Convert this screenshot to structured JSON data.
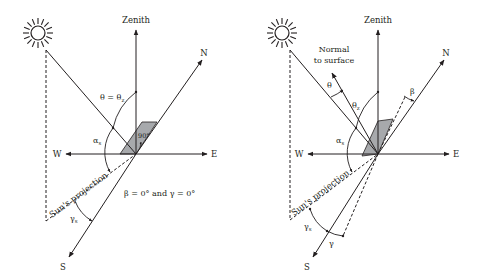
{
  "colors": {
    "line": "#231f20",
    "plate": "#a7a9ac",
    "background": "#ffffff"
  },
  "left_diagram": {
    "axes": {
      "zenith": "Zenith",
      "north": "N",
      "east": "E",
      "west": "W",
      "south": "S"
    },
    "sun_icon": "sun-icon",
    "angle_labels": {
      "theta_eq": "θ = θ",
      "theta_eq_sub": "z",
      "alpha": "α",
      "alpha_sub": "s",
      "gamma": "γ",
      "gamma_sub": "s",
      "right_angle": "90°"
    },
    "projection_label": "Sun's projection",
    "caption": "β = 0° and γ = 0°"
  },
  "right_diagram": {
    "axes": {
      "zenith": "Zenith",
      "north": "N",
      "east": "E",
      "west": "W",
      "south": "S"
    },
    "sun_icon": "sun-icon",
    "normal_label_line1": "Normal",
    "normal_label_line2": "to surface",
    "angle_labels": {
      "theta": "θ",
      "theta_z": "θ",
      "theta_z_sub": "z",
      "beta": "β",
      "alpha": "α",
      "alpha_sub": "s",
      "gamma_s": "γ",
      "gamma_s_sub": "s",
      "gamma": "γ"
    },
    "projection_label": "Sun's projection"
  }
}
